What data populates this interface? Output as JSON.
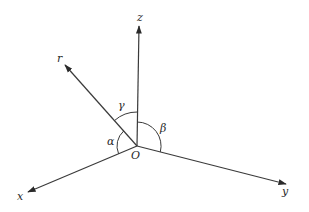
{
  "diagram": {
    "stroke_color": "#3a3a3a",
    "origin": {
      "label": "O",
      "x": 137,
      "y": 146
    },
    "axes": [
      {
        "name": "z",
        "label": "z",
        "tip": [
          139,
          25
        ]
      },
      {
        "name": "x",
        "label": "x",
        "tip": [
          27,
          192
        ]
      },
      {
        "name": "y",
        "label": "y",
        "tip": [
          287,
          184
        ]
      }
    ],
    "vector": {
      "name": "r",
      "label": "r",
      "tip": [
        64,
        64
      ]
    },
    "angles": [
      {
        "name": "alpha",
        "label": "α",
        "between": [
          "r",
          "x"
        ]
      },
      {
        "name": "beta",
        "label": "β",
        "between": [
          "z",
          "y"
        ]
      },
      {
        "name": "gamma",
        "label": "γ",
        "between": [
          "r",
          "z"
        ]
      }
    ]
  }
}
